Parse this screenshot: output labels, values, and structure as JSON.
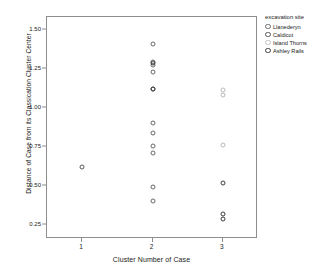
{
  "chart_data": {
    "type": "scatter",
    "title": "",
    "xlabel": "Cluster Number of Case",
    "ylabel": "Distance of Case from its Classication Cluster Center",
    "xlim": [
      0.5,
      3.5
    ],
    "ylim": [
      0.16,
      1.58
    ],
    "grid": false,
    "xticks": [
      "1",
      "2",
      "3"
    ],
    "xtick_values": [
      1,
      2,
      3
    ],
    "yticks": [
      "0.25",
      "0.50",
      "0.75",
      "1.00",
      "1.25",
      "1.50"
    ],
    "ytick_values": [
      0.25,
      0.5,
      0.75,
      1.0,
      1.25,
      1.5
    ],
    "legend": {
      "title": "excavation site",
      "position": "right",
      "entries": [
        {
          "label": "Llanederyn",
          "color": "#6a6a6a"
        },
        {
          "label": "Caldicot",
          "color": "#585858"
        },
        {
          "label": "Island Thorns",
          "color": "#c4c4c4"
        },
        {
          "label": "Ashley Rails",
          "color": "#3d3d3d"
        }
      ]
    },
    "series": [
      {
        "name": "Llanederyn",
        "color": "#6a6a6a",
        "points": [
          {
            "x": 2,
            "y": 1.41
          },
          {
            "x": 2,
            "y": 1.29
          },
          {
            "x": 2,
            "y": 1.27
          },
          {
            "x": 2,
            "y": 1.23
          },
          {
            "x": 2,
            "y": 1.12
          },
          {
            "x": 2,
            "y": 0.9
          },
          {
            "x": 2,
            "y": 0.84
          },
          {
            "x": 2,
            "y": 0.755
          },
          {
            "x": 2,
            "y": 0.71
          },
          {
            "x": 2,
            "y": 0.49
          },
          {
            "x": 2,
            "y": 0.405
          }
        ]
      },
      {
        "name": "Caldicot",
        "color": "#585858",
        "points": [
          {
            "x": 1,
            "y": 0.62
          }
        ]
      },
      {
        "name": "Island Thorns",
        "color": "#c4c4c4",
        "points": [
          {
            "x": 3,
            "y": 1.115
          },
          {
            "x": 3,
            "y": 1.08
          },
          {
            "x": 3,
            "y": 0.76
          }
        ]
      },
      {
        "name": "Ashley Rails",
        "color": "#3d3d3d",
        "points": [
          {
            "x": 3,
            "y": 0.52
          },
          {
            "x": 3,
            "y": 0.32
          },
          {
            "x": 3,
            "y": 0.29
          },
          {
            "x": 2,
            "y": 1.12
          },
          {
            "x": 2,
            "y": 1.285
          }
        ]
      }
    ]
  }
}
